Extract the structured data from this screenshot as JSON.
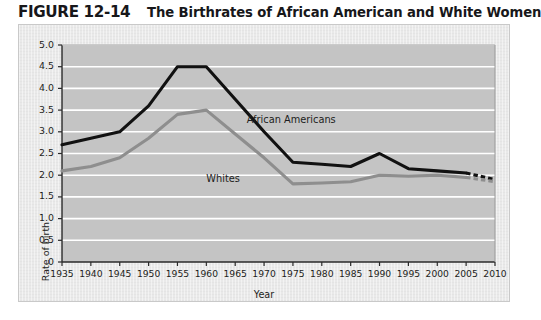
{
  "figure": {
    "number": "FIGURE 12-14",
    "caption": "The Birthrates of African American and White Women"
  },
  "colors": {
    "panel_background": "#e9e9e9",
    "plot_background": "#c4c4c4",
    "gridline": "#ffffff",
    "axis": "#2a2a2a",
    "african_americans_line": "#111111",
    "whites_line": "#8e8e8e",
    "text": "#1d1d20"
  },
  "chart_data": {
    "type": "line",
    "title": "The Birthrates of African American and White Women",
    "xlabel": "Year",
    "ylabel": "Rate of birth",
    "xlim": [
      1935,
      2010
    ],
    "ylim": [
      0,
      5.0
    ],
    "grid": true,
    "legend_position": "inline-annotation",
    "x": [
      1935,
      1940,
      1945,
      1950,
      1955,
      1960,
      1965,
      1970,
      1975,
      1980,
      1985,
      1990,
      1995,
      2000,
      2005,
      2010
    ],
    "xticklabels": [
      "1935",
      "1940",
      "1945",
      "1950",
      "1955",
      "1960",
      "1965",
      "1970",
      "1975",
      "1980",
      "1985",
      "1990",
      "1995",
      "2000",
      "2005",
      "2010"
    ],
    "yticklabels": [
      "0",
      "0.5",
      "1.0",
      "1.5",
      "2.0",
      "2.5",
      "3.0",
      "3.5",
      "4.0",
      "4.5",
      "5.0"
    ],
    "ytickvalues": [
      0,
      0.5,
      1.0,
      1.5,
      2.0,
      2.5,
      3.0,
      3.5,
      4.0,
      4.5,
      5.0
    ],
    "series": [
      {
        "name": "African Americans",
        "label": "African Americans",
        "color": "#111111",
        "values": [
          2.7,
          2.85,
          3.0,
          3.6,
          4.5,
          4.5,
          3.75,
          3.0,
          2.3,
          2.25,
          2.2,
          2.5,
          2.15,
          2.1,
          2.05,
          1.9
        ],
        "solid_through": 2005,
        "dashed_from": 2005,
        "dashed_note": "projected"
      },
      {
        "name": "Whites",
        "label": "Whites",
        "color": "#8e8e8e",
        "values": [
          2.1,
          2.2,
          2.4,
          2.85,
          3.4,
          3.5,
          2.95,
          2.4,
          1.8,
          1.82,
          1.85,
          2.0,
          1.98,
          2.0,
          1.95,
          1.85
        ],
        "solid_through": 2005,
        "dashed_from": 2005,
        "dashed_note": "projected"
      }
    ],
    "annotations": [
      {
        "text": "African Americans",
        "x": 1967,
        "y": 3.25
      },
      {
        "text": "Whites",
        "x": 1960,
        "y": 1.9
      }
    ]
  }
}
